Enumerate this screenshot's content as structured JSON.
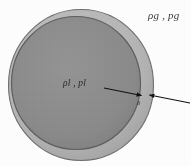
{
  "figure": {
    "background_color": "#ffffff",
    "outer_shell": {
      "name": "gas-shell",
      "fill_color": "#b6b6b6",
      "stroke_color": "#6d6d6d",
      "center_x": 81,
      "center_y": 85,
      "radius_x": 73,
      "radius_y": 76
    },
    "inner_core": {
      "name": "liquid-core",
      "fill_color": "#8b8b8b",
      "stroke_color": "#5e5e5e",
      "center_x": 76,
      "center_y": 83,
      "radius_x": 65,
      "radius_y": 67
    },
    "labels": {
      "gas": "ρg , pg",
      "gas_density_symbol": "ρg",
      "gas_pressure_symbol": "pg",
      "liquid": "ρl , pl",
      "liquid_density_symbol": "ρl",
      "liquid_pressure_symbol": "pl",
      "thickness": "δ"
    },
    "annotation": {
      "name": "shell-thickness-arrows",
      "color": "#111111",
      "inner_arrow": {
        "tail_x": 104,
        "tail_y": 88,
        "head_x": 141,
        "head_y": 95
      },
      "outer_arrow": {
        "tail_x": 190,
        "tail_y": 103,
        "head_x": 150,
        "head_y": 95
      }
    }
  }
}
